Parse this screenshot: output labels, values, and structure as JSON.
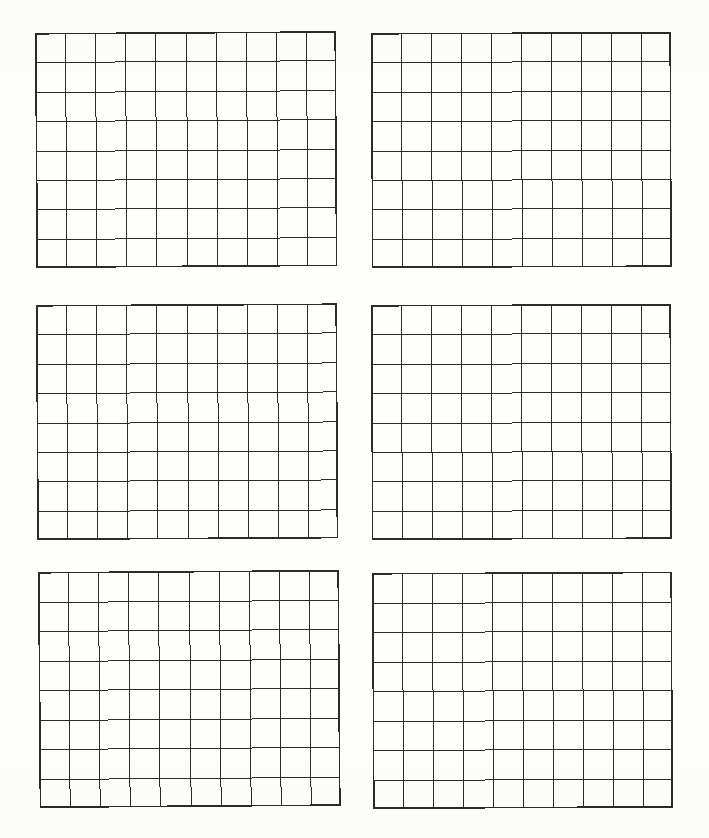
{
  "document": {
    "kind": "scanned-worksheet",
    "title": "Blank Grid Worksheet",
    "page_width": 709,
    "page_height": 838,
    "background_color": "#fdfdfc",
    "ink_color": "#2b2b2b",
    "panel_count": 6,
    "layout": "2 columns x 3 rows"
  },
  "chart_data": {
    "type": "table",
    "title": "",
    "xlabel": "",
    "ylabel": "",
    "grid_columns": 10,
    "grid_rows": 8,
    "categories": [],
    "values": [],
    "panels": [
      {
        "id": "grid-1",
        "position": "top-left",
        "columns": 10,
        "rows": 8,
        "cells_filled": 0,
        "x": 35,
        "y": 33,
        "width": 301,
        "height": 235,
        "skew_deg": -0.35,
        "outer_line_width": 1.6,
        "inner_line_width": 1.0
      },
      {
        "id": "grid-2",
        "position": "top-right",
        "columns": 10,
        "rows": 8,
        "cells_filled": 0,
        "x": 371,
        "y": 33,
        "width": 300,
        "height": 235,
        "skew_deg": -0.2,
        "outer_line_width": 1.6,
        "inner_line_width": 1.0
      },
      {
        "id": "grid-3",
        "position": "middle-left",
        "columns": 10,
        "rows": 8,
        "cells_filled": 0,
        "x": 36,
        "y": 305,
        "width": 301,
        "height": 235,
        "skew_deg": -0.3,
        "outer_line_width": 1.6,
        "inner_line_width": 1.0
      },
      {
        "id": "grid-4",
        "position": "middle-right",
        "columns": 10,
        "rows": 8,
        "cells_filled": 0,
        "x": 371,
        "y": 305,
        "width": 300,
        "height": 235,
        "skew_deg": -0.2,
        "outer_line_width": 1.6,
        "inner_line_width": 1.0
      },
      {
        "id": "grid-5",
        "position": "bottom-left",
        "columns": 10,
        "rows": 8,
        "cells_filled": 0,
        "x": 38,
        "y": 572,
        "width": 301,
        "height": 236,
        "skew_deg": -0.4,
        "outer_line_width": 1.6,
        "inner_line_width": 1.0
      },
      {
        "id": "grid-6",
        "position": "bottom-right",
        "columns": 10,
        "rows": 8,
        "cells_filled": 0,
        "x": 372,
        "y": 573,
        "width": 300,
        "height": 236,
        "skew_deg": -0.25,
        "outer_line_width": 1.6,
        "inner_line_width": 1.0
      }
    ]
  }
}
